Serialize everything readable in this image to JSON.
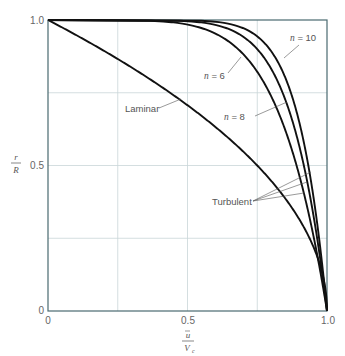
{
  "chart_data": {
    "type": "line",
    "title": "",
    "xlabel": "ū / V_c",
    "ylabel": "r / R",
    "xlabel_num": "ū",
    "xlabel_den": "V",
    "xlabel_den_sub": "c",
    "ylabel_num": "r",
    "ylabel_den": "R",
    "xlim": [
      0,
      1.0
    ],
    "ylim": [
      0,
      1.0
    ],
    "grid": true,
    "x_ticks": [
      "0",
      "0.5",
      "1.0"
    ],
    "y_ticks": [
      "0",
      "0.5",
      "1.0"
    ],
    "gridlines": [
      0.25,
      0.5,
      0.75
    ],
    "series": [
      {
        "name": "Laminar",
        "formula": "u/Vc = 1 - (r/R)^2",
        "points": [
          [
            1.0,
            0
          ],
          [
            0.9975,
            0.05
          ],
          [
            0.99,
            0.1
          ],
          [
            0.96,
            0.2
          ],
          [
            0.91,
            0.3
          ],
          [
            0.84,
            0.4
          ],
          [
            0.75,
            0.5
          ],
          [
            0.64,
            0.6
          ],
          [
            0.51,
            0.7
          ],
          [
            0.36,
            0.8
          ],
          [
            0.19,
            0.9
          ],
          [
            0.0,
            1.0
          ]
        ]
      },
      {
        "name": "n = 6",
        "formula": "u/Vc = (1 - r/R)^(1/6)",
        "points": [
          [
            1.0,
            0
          ],
          [
            0.96,
            0.2
          ],
          [
            0.92,
            0.4
          ],
          [
            0.89,
            0.5
          ],
          [
            0.84,
            0.6
          ],
          [
            0.77,
            0.7
          ],
          [
            0.69,
            0.8
          ],
          [
            0.61,
            0.9
          ],
          [
            0.46,
            0.99
          ],
          [
            0.0,
            1.0
          ]
        ]
      },
      {
        "name": "n = 8",
        "formula": "u/Vc = (1 - r/R)^(1/8)",
        "points": [
          [
            1.0,
            0
          ],
          [
            0.97,
            0.2
          ],
          [
            0.94,
            0.4
          ],
          [
            0.92,
            0.5
          ],
          [
            0.89,
            0.6
          ],
          [
            0.83,
            0.7
          ],
          [
            0.76,
            0.8
          ],
          [
            0.69,
            0.9
          ],
          [
            0.56,
            0.99
          ],
          [
            0.0,
            1.0
          ]
        ]
      },
      {
        "name": "n = 10",
        "formula": "u/Vc = (1 - r/R)^(1/10)",
        "points": [
          [
            1.0,
            0
          ],
          [
            0.98,
            0.2
          ],
          [
            0.95,
            0.4
          ],
          [
            0.93,
            0.5
          ],
          [
            0.91,
            0.6
          ],
          [
            0.87,
            0.7
          ],
          [
            0.81,
            0.8
          ],
          [
            0.74,
            0.9
          ],
          [
            0.63,
            0.99
          ],
          [
            0.0,
            1.0
          ]
        ]
      }
    ],
    "annotations": [
      "n = 10",
      "n = 6",
      "n = 8",
      "Laminar",
      "Turbulent"
    ]
  },
  "labels": {
    "n10": "n = 10",
    "n6": "n = 6",
    "n8": "n = 8",
    "laminar": "Laminar",
    "turbulent": "Turbulent",
    "tick_x0": "0",
    "tick_x05": "0.5",
    "tick_x1": "1.0",
    "tick_y0": "0",
    "tick_y05": "0.5",
    "tick_y1": "1.0"
  },
  "colors": {
    "curve": "#111111",
    "axis": "#4a6a70",
    "grid": "#c9d6d8"
  }
}
